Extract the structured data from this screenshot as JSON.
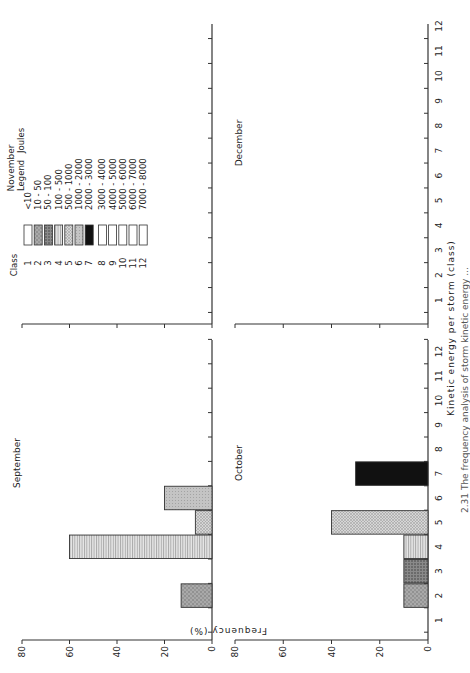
{
  "chart_data": [
    {
      "type": "bar",
      "title": "September",
      "categories": [
        1,
        2,
        3,
        4,
        5,
        6,
        7,
        8,
        9,
        10,
        11,
        12
      ],
      "values": [
        0,
        13,
        0,
        60,
        7,
        20,
        0,
        0,
        0,
        0,
        0,
        0
      ],
      "xlabel": "Kinetic energy per storm (class)",
      "ylabel": "Frequency (%)",
      "ylim": [
        0,
        80
      ],
      "yticks": [
        0,
        20,
        40,
        60,
        80
      ]
    },
    {
      "type": "bar",
      "title": "October",
      "categories": [
        1,
        2,
        3,
        4,
        5,
        6,
        7,
        8,
        9,
        10,
        11,
        12
      ],
      "values": [
        0,
        10,
        10,
        10,
        40,
        0,
        30,
        0,
        0,
        0,
        0,
        0
      ],
      "xlabel": "Kinetic energy per storm (class)",
      "ylabel": "Frequency (%)",
      "ylim": [
        0,
        80
      ],
      "yticks": [
        0,
        20,
        40,
        60,
        80
      ]
    },
    {
      "type": "bar",
      "title": "November",
      "categories": [
        1,
        2,
        3,
        4,
        5,
        6,
        7,
        8,
        9,
        10,
        11,
        12
      ],
      "values": [
        0,
        0,
        0,
        0,
        0,
        0,
        0,
        0,
        0,
        0,
        0,
        0
      ],
      "xlabel": "Kinetic energy per storm (class)",
      "ylabel": "Frequency (%)",
      "ylim": [
        0,
        80
      ]
    },
    {
      "type": "bar",
      "title": "December",
      "categories": [
        1,
        2,
        3,
        4,
        5,
        6,
        7,
        8,
        9,
        10,
        11,
        12
      ],
      "values": [
        0,
        0,
        0,
        0,
        0,
        0,
        0,
        0,
        0,
        0,
        0,
        0
      ],
      "xlabel": "Kinetic energy per storm (class)",
      "ylabel": "Frequency (%)",
      "ylim": [
        0,
        80
      ]
    }
  ],
  "figure": {
    "rotation_deg": -90,
    "ylabel": "Frequency   (%)",
    "xlabel": "Kinetic   energy   per   storm   (class)",
    "x_tick_labels": [
      "1",
      "2",
      "3",
      "4",
      "5",
      "6",
      "7",
      "8",
      "9",
      "10",
      "11",
      "12"
    ],
    "y_tick_labels": [
      "0",
      "20",
      "40",
      "60",
      "80"
    ],
    "caption_fragment": "2.31   The  frequency  analysis  of  storm  kinetic  energy ..."
  },
  "legend": {
    "header_class": "Class",
    "header_legend": "Legend",
    "header_joules": "Joules",
    "units": "(Joules)",
    "items": [
      {
        "class": "1",
        "range": "<10",
        "pattern": "empty"
      },
      {
        "class": "2",
        "range": "10 - 50",
        "pattern": "grey-stipple"
      },
      {
        "class": "3",
        "range": "50 - 100",
        "pattern": "dark-stipple"
      },
      {
        "class": "4",
        "range": "100 - 500",
        "pattern": "horizontal-lines"
      },
      {
        "class": "5",
        "range": "500 - 1000",
        "pattern": "light-crosshatch"
      },
      {
        "class": "6",
        "range": "1000 - 2000",
        "pattern": "light-grey"
      },
      {
        "class": "7",
        "range": "2000 - 3000",
        "pattern": "solid-black"
      },
      {
        "class": "8",
        "range": "3000 - 4000",
        "pattern": "empty"
      },
      {
        "class": "9",
        "range": "4000 - 5000",
        "pattern": "empty"
      },
      {
        "class": "10",
        "range": "5000 - 6000",
        "pattern": "empty"
      },
      {
        "class": "11",
        "range": "6000 - 7000",
        "pattern": "empty"
      },
      {
        "class": "12",
        "range": "7000 - 8000",
        "pattern": "empty"
      }
    ]
  },
  "colors": {
    "axis": "#333333",
    "black_bar": "#111111",
    "grey_dark": "#8a8a8a",
    "grey_mid": "#b0b0b0",
    "grey_light": "#d0d0d0"
  }
}
